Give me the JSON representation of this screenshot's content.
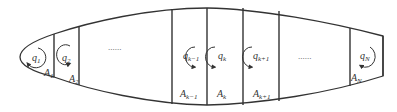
{
  "diagram": {
    "stroke_color": "#333333",
    "background": "#ffffff",
    "cells": [
      {
        "q_base": "q",
        "q_sub": "1",
        "a_base": "A",
        "a_sub": "1"
      },
      {
        "q_base": "q",
        "q_sub": "2",
        "a_base": "A",
        "a_sub": "2"
      },
      {
        "ellipsis": "......"
      },
      {
        "q_base": "q",
        "q_sub": "k−1",
        "a_base": "A",
        "a_sub": "k−1"
      },
      {
        "q_base": "q",
        "q_sub": "k",
        "a_base": "A",
        "a_sub": "k"
      },
      {
        "q_base": "q",
        "q_sub": "k+1",
        "a_base": "A",
        "a_sub": "k+1"
      },
      {
        "ellipsis": "......"
      },
      {
        "q_base": "q",
        "q_sub": "N",
        "a_base": "A",
        "a_sub": "N"
      }
    ]
  }
}
